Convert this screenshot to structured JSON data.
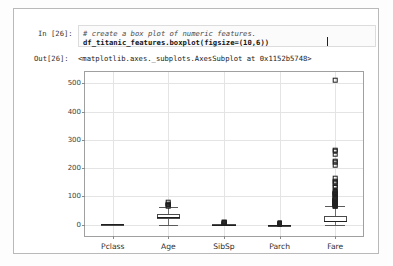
{
  "notebook": {
    "in_prompt": "In [26]:",
    "out_prompt": "Out[26]:",
    "code_comment": "# create a box plot of numeric features.",
    "code_statement": "df_titanic_features.boxplot(figsize=(10,6))",
    "output_text": "<matplotlib.axes._subplots.AxesSubplot at 0x1152b5748>"
  },
  "chart_data": {
    "type": "box",
    "title": "",
    "xlabel": "",
    "ylabel": "",
    "grid": true,
    "legend": false,
    "ylim": [
      -40,
      540
    ],
    "yticks": [
      0,
      100,
      200,
      300,
      400,
      500
    ],
    "ytick_labels": [
      "0",
      "100",
      "200",
      "300",
      "400",
      "500"
    ],
    "categories": [
      "Pclass",
      "Age",
      "SibSp",
      "Parch",
      "Fare"
    ],
    "boxes": [
      {
        "name": "Pclass",
        "whisker_low": 1,
        "q1": 2,
        "median": 3,
        "q3": 3,
        "whisker_high": 3,
        "fliers": []
      },
      {
        "name": "Age",
        "whisker_low": 0.42,
        "q1": 20.1,
        "median": 28.0,
        "q3": 38.0,
        "whisker_high": 64.0,
        "fliers": [
          66,
          70,
          70.5,
          71,
          74,
          80
        ]
      },
      {
        "name": "SibSp",
        "whisker_low": 0,
        "q1": 0,
        "median": 0,
        "q3": 1,
        "whisker_high": 2,
        "fliers": [
          3,
          4,
          5,
          8
        ]
      },
      {
        "name": "Parch",
        "whisker_low": 0,
        "q1": 0,
        "median": 0,
        "q3": 0,
        "whisker_high": 0,
        "fliers": [
          1,
          2,
          3,
          4,
          5,
          6
        ]
      },
      {
        "name": "Fare",
        "whisker_low": 0,
        "q1": 7.91,
        "median": 14.45,
        "q3": 31.0,
        "whisker_high": 65.0,
        "fliers": [
          66,
          69,
          71,
          73,
          76,
          78,
          79,
          80,
          82,
          83,
          86,
          89,
          91,
          93,
          106,
          108,
          110,
          113,
          120,
          134,
          135,
          146,
          151,
          153,
          164,
          211,
          221,
          227,
          247,
          262,
          263,
          512
        ]
      }
    ]
  },
  "axis_colors": {
    "grid": "#e4e4e4",
    "frame": "#a0a0a0",
    "box_edge": "#4a4a4a",
    "median": "#1f1f1f",
    "flier": "#1e1e1e"
  }
}
